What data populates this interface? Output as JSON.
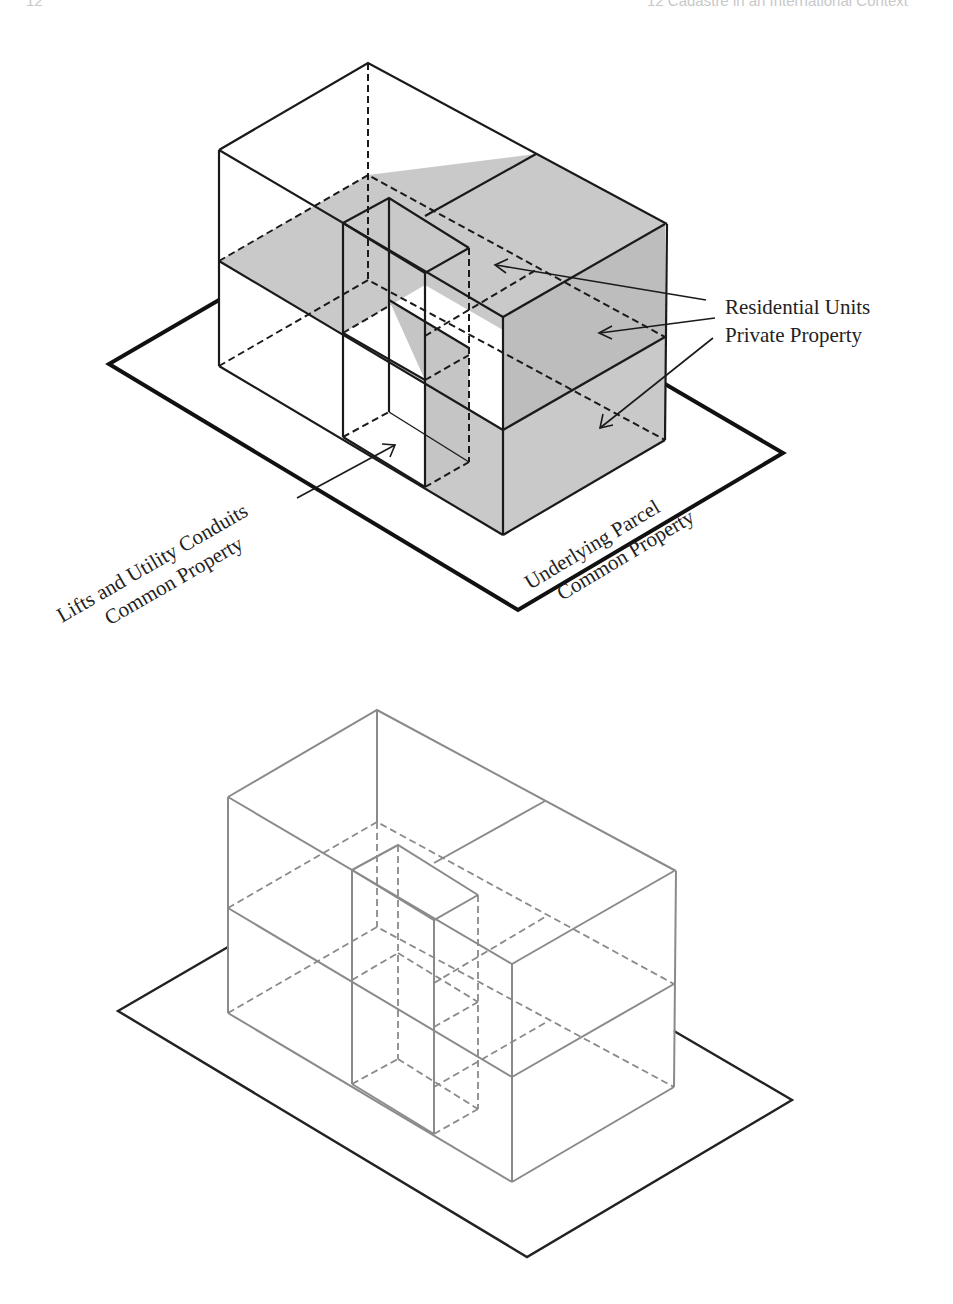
{
  "running_head": {
    "page_number": "12",
    "chapter_title": "12  Cadastre in an International Context"
  },
  "figure_top": {
    "description": "3D condominium parcel with shaded private units",
    "labels": {
      "residential_line1": "Residential  Units",
      "residential_line2": "Private Property",
      "lifts_line1": "Lifts and Utility Conduits",
      "lifts_line2": "Common Property",
      "parcel_line1": "Underlying Parcel",
      "parcel_line2": "Common Property"
    },
    "colors": {
      "line": "#1a1a1a",
      "shade": "#c9c9c9",
      "shade_dark": "#bdbdbd",
      "base": "#111111"
    }
  },
  "figure_bottom": {
    "description": "Wireframe of same 3D building volumes without shading",
    "colors": {
      "line": "#8a8a8a",
      "base": "#222222"
    }
  }
}
